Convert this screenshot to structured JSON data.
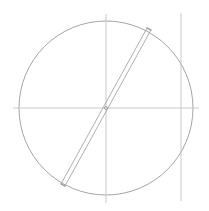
{
  "diagram": {
    "type": "geometric-construction",
    "colors": {
      "background": "#ffffff",
      "stroke": "#9a9a9a",
      "stroke_light": "#c4c4c4"
    },
    "circle": {
      "cx": 106,
      "cy": 108,
      "r": 87
    },
    "horizontal_axis": {
      "x1": 13,
      "y1": 108,
      "x2": 199,
      "y2": 108
    },
    "vertical_axis": {
      "x1": 106,
      "y1": 14,
      "x2": 106,
      "y2": 203
    },
    "right_vertical_line": {
      "x1": 181,
      "y1": 13,
      "x2": 181,
      "y2": 201
    },
    "diameter_bar": {
      "x1": 149,
      "y1": 29,
      "x2": 63,
      "y2": 185,
      "gap": 2.2
    },
    "top_strip_text": ""
  }
}
